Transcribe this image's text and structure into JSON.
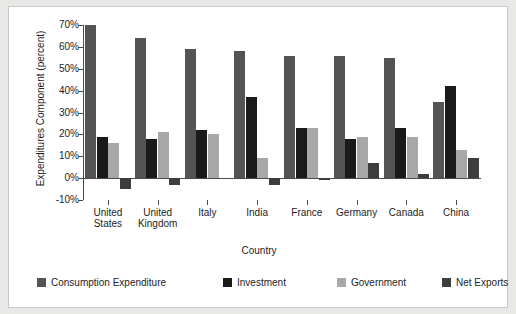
{
  "chart_data": {
    "type": "bar",
    "title": "",
    "xlabel": "Country",
    "ylabel": "Expenditures Component (percent)",
    "categories": [
      "United States",
      "United Kingdom",
      "Italy",
      "India",
      "France",
      "Germany",
      "Canada",
      "China"
    ],
    "category_lines": [
      [
        "United",
        "States"
      ],
      [
        "United",
        "Kingdom"
      ],
      [
        "Italy",
        ""
      ],
      [
        "India",
        ""
      ],
      [
        "France",
        ""
      ],
      [
        "Germany",
        ""
      ],
      [
        "Canada",
        ""
      ],
      [
        "China",
        ""
      ]
    ],
    "series": [
      {
        "name": "Consumption Expenditure",
        "color": "#545454",
        "values": [
          70,
          64,
          59,
          58,
          56,
          56,
          55,
          35
        ]
      },
      {
        "name": "Investment",
        "color": "#1a1a1a",
        "values": [
          19,
          18,
          22,
          37,
          23,
          18,
          23,
          42
        ]
      },
      {
        "name": "Government",
        "color": "#a8a8a8",
        "values": [
          16,
          21,
          20,
          9,
          23,
          19,
          19,
          13
        ]
      },
      {
        "name": "Net Exports",
        "color": "#3d3d3d",
        "values": [
          -5,
          -3,
          0,
          -3,
          -1,
          7,
          2,
          9
        ]
      }
    ],
    "ylim": [
      -10,
      70
    ],
    "ytick_labels": [
      "70%",
      "60%",
      "50%",
      "40%",
      "30%",
      "20%",
      "10%",
      "0%",
      "-10%"
    ],
    "ytick_values": [
      70,
      60,
      50,
      40,
      30,
      20,
      10,
      0,
      -10
    ],
    "grid": false,
    "legend_position": "bottom"
  },
  "legend": {
    "items": [
      {
        "label": "Consumption Expenditure",
        "color": "#545454"
      },
      {
        "label": "Investment",
        "color": "#1a1a1a"
      },
      {
        "label": "Government",
        "color": "#a8a8a8"
      },
      {
        "label": "Net Exports",
        "color": "#3d3d3d"
      }
    ]
  }
}
